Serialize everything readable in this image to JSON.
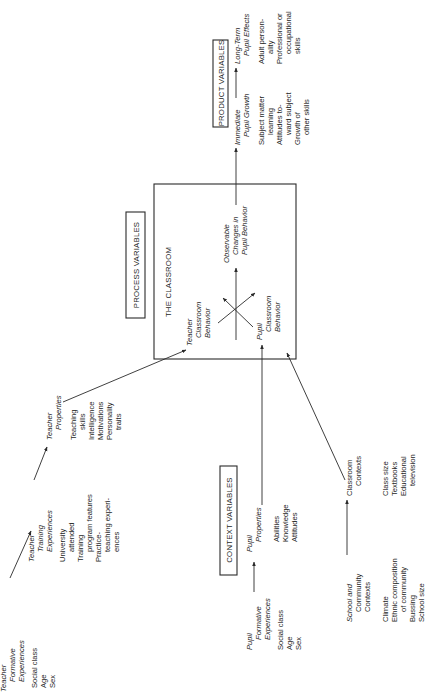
{
  "diagram": {
    "orientation": "rotated 90deg counterclockwise",
    "sections": {
      "context": "CONTEXT VARIABLES",
      "process": "PROCESS VARIABLES",
      "product": "PRODUCT VARIABLES"
    },
    "classroom": {
      "title": "THE CLASSROOM",
      "teacher_behavior": [
        "Teacher",
        "Classroom",
        "Behavior"
      ],
      "pupil_behavior": [
        "Pupil",
        "Classroom",
        "Behavior"
      ],
      "observable_changes": [
        "Observable",
        "Changes in",
        "Pupil Behavior"
      ]
    },
    "nodes": {
      "teacher_formative": {
        "title": [
          "Teacher",
          "Formative",
          "Experiences"
        ],
        "items": [
          "Social class",
          "Age",
          "Sex"
        ]
      },
      "teacher_training": {
        "title": [
          "Teacher",
          "Training",
          "Experiences"
        ],
        "items": [
          "University",
          "attended",
          "Training",
          "program features",
          "Practice-",
          "teaching experi-",
          "ences"
        ]
      },
      "teacher_properties": {
        "title": [
          "Teacher",
          "Properties"
        ],
        "items": [
          "Teaching",
          "skills",
          "Intelligence",
          "Motivations",
          "Personality",
          "traits"
        ]
      },
      "pupil_formative": {
        "title": [
          "Pupil",
          "Formative",
          "Experiences"
        ],
        "items": [
          "Social class",
          "Age",
          "Sex"
        ]
      },
      "pupil_properties": {
        "title": [
          "Pupil",
          "Properties"
        ],
        "items": [
          "Abilities",
          "Knowledge",
          "Attitudes"
        ]
      },
      "school_community": {
        "title": [
          "School and",
          "Community",
          "Contexts"
        ],
        "items": [
          "Climate",
          "Ethnic composition",
          "of community",
          "Bussing",
          "School size"
        ]
      },
      "classroom_contexts": {
        "title": [
          "Classroom",
          "Contexts"
        ],
        "items": [
          "Class size",
          "Textbooks",
          "Educational",
          "television"
        ]
      },
      "immediate_growth": {
        "title": [
          "Immediate",
          "Pupil Growth"
        ],
        "items": [
          "Subject matter",
          "learning",
          "Attitudes to-",
          "ward subject",
          "Growth of",
          "other skills"
        ]
      },
      "long_term": {
        "title": [
          "Long-Term",
          "Pupil Effects"
        ],
        "items": [
          "Adult person-",
          "ality",
          "Professional or",
          "occupational",
          "skills"
        ]
      }
    },
    "edges": [
      [
        "Teacher Formative Experiences",
        "Teacher Training Experiences"
      ],
      [
        "Teacher Training Experiences",
        "Teacher Properties"
      ],
      [
        "Teacher Properties",
        "Teacher Classroom Behavior"
      ],
      [
        "Pupil Formative Experiences",
        "Pupil Properties"
      ],
      [
        "Pupil Properties",
        "Pupil Classroom Behavior"
      ],
      [
        "School and Community Contexts",
        "Classroom Contexts"
      ],
      [
        "Classroom Contexts",
        "Pupil Classroom Behavior"
      ],
      [
        "Teacher Classroom Behavior",
        "Pupil Classroom Behavior"
      ],
      [
        "Pupil Classroom Behavior",
        "Teacher Classroom Behavior"
      ],
      [
        "Classroom Behaviors",
        "Observable Changes in Pupil Behavior"
      ],
      [
        "Observable Changes in Pupil Behavior",
        "Immediate Pupil Growth"
      ],
      [
        "Immediate Pupil Growth",
        "Long-Term Pupil Effects"
      ]
    ]
  }
}
